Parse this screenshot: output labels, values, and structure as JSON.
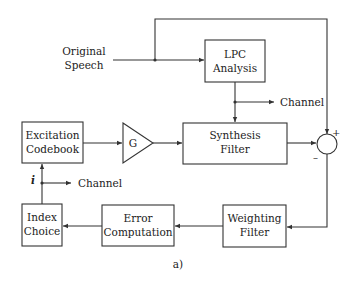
{
  "diagram": {
    "caption": "a)",
    "input": {
      "line1": "Original",
      "line2": "Speech"
    },
    "blocks": {
      "lpc": {
        "line1": "LPC",
        "line2": "Analysis"
      },
      "synthesis": {
        "line1": "Synthesis",
        "line2": "Filter"
      },
      "excitation": {
        "line1": "Excitation",
        "line2": "Codebook"
      },
      "gain": {
        "label": "G"
      },
      "index": {
        "line1": "Index",
        "line2": "Choice"
      },
      "error": {
        "line1": "Error",
        "line2": "Computation"
      },
      "weighting": {
        "line1": "Weighting",
        "line2": "Filter"
      }
    },
    "summer": {
      "plus": "+",
      "minus": "–"
    },
    "outputs": {
      "lpc_channel": "Channel",
      "index_channel": "Channel",
      "index_symbol": "i"
    },
    "colors": {
      "stroke": "#333333",
      "background": "#ffffff",
      "text": "#222222"
    }
  }
}
